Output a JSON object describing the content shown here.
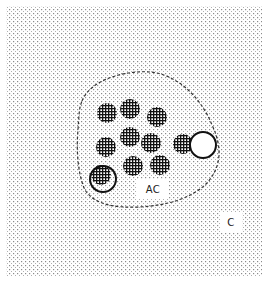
{
  "figure": {
    "background_color": "#ffffff",
    "stipple_color": "#8a8a8a",
    "ink_color": "#111111",
    "field": {
      "x": 6,
      "y": 6,
      "width": 256,
      "height": 271
    },
    "boundary": {
      "style": "dashed",
      "path": "M 82 101 C 90 80, 125 70, 150 72 C 175 74, 200 95, 212 125 C 224 150, 220 170, 205 185 C 190 198, 170 205, 140 207 C 115 208, 95 205, 85 190 C 78 175, 76 150, 78 130 C 79 115, 79 108, 82 101 Z"
    },
    "labels": [
      {
        "id": "ac",
        "text": "AC",
        "x": 137,
        "y": 179,
        "width": 32,
        "height": 20
      },
      {
        "id": "c",
        "text": "C",
        "x": 220,
        "y": 212,
        "width": 22,
        "height": 20
      }
    ],
    "filled_circles": [
      {
        "cx": 107,
        "cy": 113,
        "r": 10
      },
      {
        "cx": 130,
        "cy": 109,
        "r": 10
      },
      {
        "cx": 157,
        "cy": 117,
        "r": 10
      },
      {
        "cx": 130,
        "cy": 137,
        "r": 10
      },
      {
        "cx": 106,
        "cy": 147,
        "r": 10
      },
      {
        "cx": 151,
        "cy": 143,
        "r": 10
      },
      {
        "cx": 183,
        "cy": 144,
        "r": 10
      },
      {
        "cx": 133,
        "cy": 166,
        "r": 10
      },
      {
        "cx": 160,
        "cy": 165,
        "r": 10
      },
      {
        "cx": 101,
        "cy": 175,
        "r": 10
      }
    ],
    "open_circles": [
      {
        "cx": 203,
        "cy": 145,
        "r": 13
      },
      {
        "cx": 103,
        "cy": 179,
        "r": 13
      }
    ]
  }
}
